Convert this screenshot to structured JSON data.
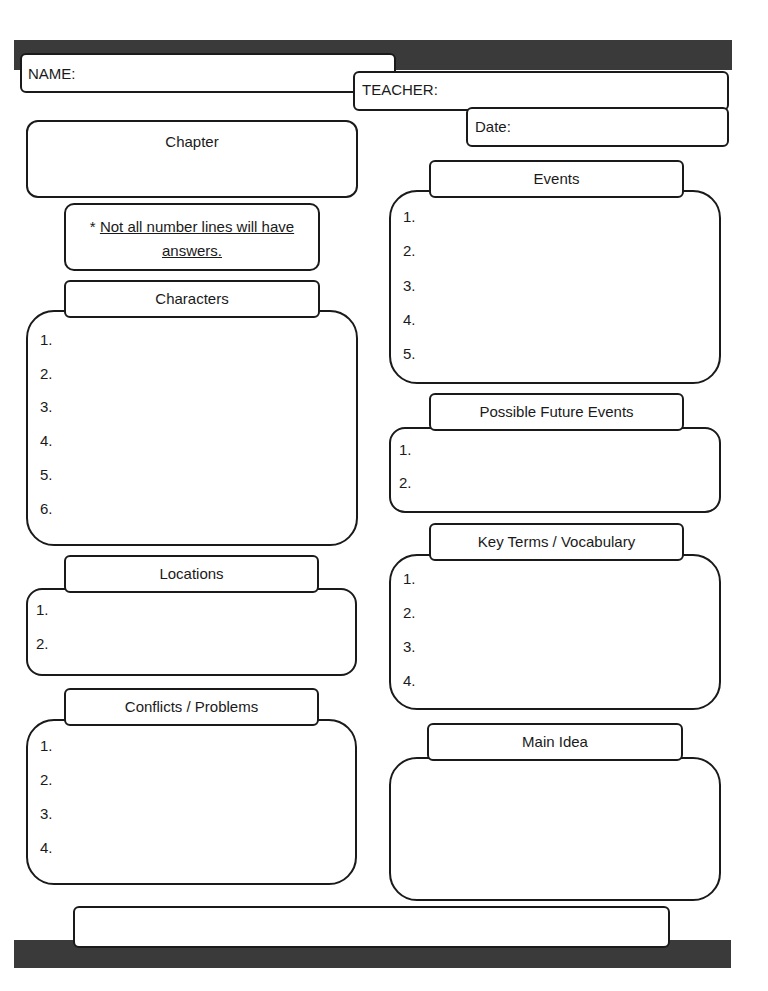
{
  "header": {
    "name_label": "NAME:",
    "teacher_label": "TEACHER:",
    "date_label": "Date:"
  },
  "chapter": {
    "label": "Chapter"
  },
  "note": {
    "prefix": "* ",
    "line1": "Not all number lines will have",
    "line2": "answers."
  },
  "characters": {
    "title": "Characters",
    "items": [
      "1.",
      "2.",
      "3.",
      "4.",
      "5.",
      "6."
    ]
  },
  "locations": {
    "title": "Locations",
    "items": [
      "1.",
      "2."
    ]
  },
  "conflicts": {
    "title": "Conflicts / Problems",
    "items": [
      "1.",
      "2.",
      "3.",
      "4."
    ]
  },
  "events": {
    "title": "Events",
    "items": [
      "1.",
      "2.",
      "3.",
      "4.",
      "5."
    ]
  },
  "future_events": {
    "title": "Possible Future Events",
    "items": [
      "1.",
      "2."
    ]
  },
  "vocabulary": {
    "title": "Key Terms / Vocabulary",
    "items": [
      "1.",
      "2.",
      "3.",
      "4."
    ]
  },
  "main_idea": {
    "title": "Main Idea"
  },
  "colors": {
    "bar": "#3a3a3a",
    "border": "#1a1a1a",
    "background": "#ffffff"
  }
}
